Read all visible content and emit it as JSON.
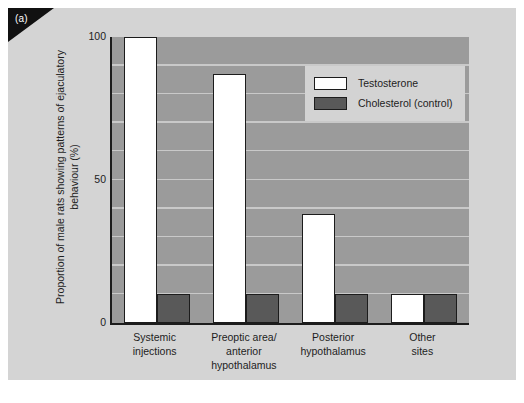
{
  "figure": {
    "panel_label": "(a)",
    "background_color": "#d4d4d4",
    "plot_background_color": "#9b9b9b",
    "gridline_color": "#c9c9c9",
    "axis_color": "#1c1c1c"
  },
  "legend": {
    "position": "top-right-inside",
    "background_color": "#d3d3d3",
    "entries": [
      {
        "label": "Testosterone",
        "color": "#ffffff",
        "key": "testosterone"
      },
      {
        "label": "Cholesterol (control)",
        "color": "#595959",
        "key": "cholesterol"
      }
    ]
  },
  "chart_data": {
    "type": "bar",
    "title": "",
    "xlabel": "",
    "ylabel": "Proportion of male rats showing patterns of ejaculatory behaviour (%)",
    "ylim": [
      0,
      100
    ],
    "yticks": [
      0,
      50,
      100
    ],
    "ytick_labels": [
      "0",
      "50",
      "100"
    ],
    "gridlines": true,
    "grid_interval": 10,
    "categories": [
      "Systemic injections",
      "Preoptic area/ anterior hypothalamus",
      "Posterior hypothalamus",
      "Other sites"
    ],
    "category_lines": [
      [
        "Systemic",
        "injections"
      ],
      [
        "Preoptic area/",
        "anterior",
        "hypothalamus"
      ],
      [
        "Posterior",
        "hypothalamus"
      ],
      [
        "Other",
        "sites"
      ]
    ],
    "series": [
      {
        "name": "Testosterone",
        "color": "#ffffff",
        "values": [
          100,
          87,
          38,
          10
        ]
      },
      {
        "name": "Cholesterol (control)",
        "color": "#595959",
        "values": [
          10,
          10,
          10,
          10
        ]
      }
    ]
  }
}
